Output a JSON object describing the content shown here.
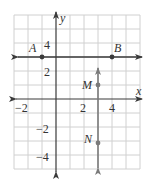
{
  "figure": {
    "type": "coordinate-plane",
    "grid": {
      "x_min": -3,
      "x_max": 6,
      "y_min": -5,
      "y_max": 6,
      "step": 1
    },
    "axes": {
      "x_label": "x",
      "y_label": "y",
      "x_ticks": [
        {
          "value": -2,
          "label": "−2"
        },
        {
          "value": 2,
          "label": "2"
        },
        {
          "value": 4,
          "label": "4"
        }
      ],
      "y_ticks": [
        {
          "value": 4,
          "label": "4"
        },
        {
          "value": 2,
          "label": "2"
        },
        {
          "value": -2,
          "label": "−2"
        },
        {
          "value": -4,
          "label": "−4"
        }
      ]
    },
    "lines": [
      {
        "name": "AB",
        "orientation": "horizontal",
        "y": 3,
        "color": "#3a3a3a"
      },
      {
        "name": "MN",
        "orientation": "vertical",
        "x": 3,
        "color": "#7a7a7a"
      }
    ],
    "points": [
      {
        "label": "A",
        "x": -1,
        "y": 3
      },
      {
        "label": "B",
        "x": 4,
        "y": 3
      },
      {
        "label": "M",
        "x": 3,
        "y": 1
      },
      {
        "label": "N",
        "x": 3,
        "y": -3
      }
    ],
    "colors": {
      "grid": "#d0d0d0",
      "axis": "#3a3a3a",
      "line_ab": "#3a3a3a",
      "line_mn": "#7a7a7a"
    }
  }
}
